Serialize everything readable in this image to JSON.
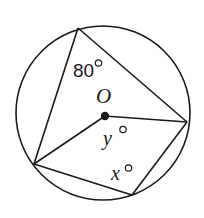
{
  "diagram": {
    "type": "circle-geometry",
    "stroke_color": "#1a1a1a",
    "background_color": "#ffffff",
    "circle": {
      "center": [
        103,
        113
      ],
      "radius": 87
    },
    "points": {
      "top": [
        78,
        28
      ],
      "right": [
        187,
        122
      ],
      "left": [
        34,
        164
      ],
      "bottom": [
        132,
        195
      ],
      "center": [
        105,
        116
      ]
    },
    "segments": [
      [
        "top",
        "left"
      ],
      [
        "top",
        "right"
      ],
      [
        "center",
        "right"
      ],
      [
        "center",
        "left"
      ],
      [
        "left",
        "bottom"
      ],
      [
        "bottom",
        "right"
      ]
    ],
    "labels": {
      "inscribed_angle": {
        "number": "80",
        "degree": "°"
      },
      "center_label": "O",
      "central_angle": {
        "variable": "y",
        "degree": "°"
      },
      "opposite_angle": {
        "variable": "x",
        "degree": "°"
      }
    }
  }
}
